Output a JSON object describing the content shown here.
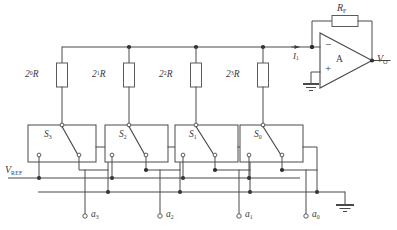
{
  "figure": {
    "kind": "binary-weighted-resistor-dac",
    "colors": {
      "wire": "#4a4a4a",
      "junction": "#2b2b2b",
      "text": "#3a3a3a",
      "background": "#ffffff"
    }
  },
  "resistors": [
    {
      "id": "r0",
      "base": "2",
      "exponent": "0",
      "suffix": "R",
      "x": 62,
      "y_top": 47,
      "y_bot": 125,
      "label_x": 27,
      "label_y": 75
    },
    {
      "id": "r1",
      "base": "2",
      "exponent": "1",
      "suffix": "R",
      "x": 129,
      "y_top": 47,
      "y_bot": 125,
      "label_x": 94,
      "label_y": 75
    },
    {
      "id": "r2",
      "base": "2",
      "exponent": "2",
      "suffix": "R",
      "x": 196,
      "y_top": 47,
      "y_bot": 125,
      "label_x": 161,
      "label_y": 75
    },
    {
      "id": "r3",
      "base": "2",
      "exponent": "3",
      "suffix": "R",
      "x": 263,
      "y_top": 47,
      "y_bot": 125,
      "label_x": 228,
      "label_y": 75
    }
  ],
  "switches": [
    {
      "id": "s3",
      "label": "S",
      "index": "3",
      "box_x": 28,
      "box_y": 125,
      "label_x": 46,
      "label_y": 133
    },
    {
      "id": "s2",
      "label": "S",
      "index": "2",
      "box_x": 105,
      "box_y": 125,
      "label_x": 120,
      "label_y": 133
    },
    {
      "id": "s1",
      "label": "S",
      "index": "1",
      "box_x": 175,
      "box_y": 125,
      "label_x": 190,
      "label_y": 133
    },
    {
      "id": "s0",
      "label": "S",
      "index": "0",
      "box_x": 240,
      "box_y": 125,
      "label_x": 255,
      "label_y": 133
    }
  ],
  "bit_inputs": [
    {
      "id": "a3",
      "label": "a",
      "index": "3",
      "x": 85,
      "terminal_y": 217,
      "label_x": 91,
      "label_y": 211
    },
    {
      "id": "a2",
      "label": "a",
      "index": "2",
      "x": 160,
      "terminal_y": 217,
      "label_x": 166,
      "label_y": 211
    },
    {
      "id": "a1",
      "label": "a",
      "index": "1",
      "x": 239,
      "terminal_y": 217,
      "label_x": 245,
      "label_y": 211
    },
    {
      "id": "a0",
      "label": "a",
      "index": "0",
      "x": 306,
      "terminal_y": 217,
      "label_x": 312,
      "label_y": 211
    }
  ],
  "labels": {
    "vref": {
      "text": "V",
      "sub": "REF",
      "x": 6,
      "y": 166
    },
    "feedback_resistor": {
      "text": "R",
      "sub": "F",
      "x": 338,
      "y": 8
    },
    "output": {
      "text": "V",
      "sub": "O",
      "x": 378,
      "y": 46
    },
    "input_current": {
      "text": "I",
      "sub": "1",
      "x": 296,
      "y": 56
    },
    "amp_designator": {
      "text": "A",
      "x": 340,
      "y": 60
    },
    "inverting_input": {
      "text": "−",
      "x": 326,
      "y": 45
    },
    "noninverting_input": {
      "text": "+",
      "x": 326,
      "y": 68
    }
  },
  "buses": {
    "top_rail": {
      "label": "summing-node-rail",
      "y": 47,
      "x_start": 62,
      "x_end": 312
    },
    "vref_rail": {
      "label": "reference-voltage-rail",
      "y": 178,
      "x_start": 8,
      "x_end": 300
    },
    "ground_rail": {
      "label": "ground-return-rail",
      "y": 192,
      "x_start": 38,
      "x_end": 345
    }
  },
  "ground_symbols": [
    {
      "id": "gnd-opamp",
      "x": 311,
      "y": 72
    },
    {
      "id": "gnd-bus",
      "x": 345,
      "y": 192
    }
  ]
}
